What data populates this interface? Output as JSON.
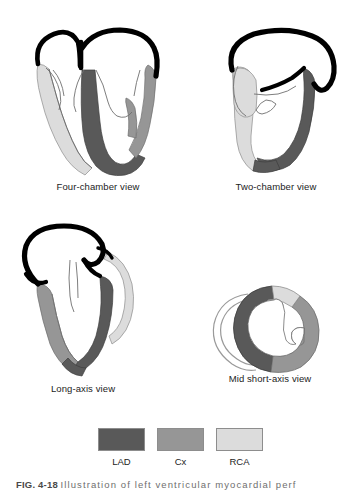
{
  "figure": {
    "number": "FIG. 4-18",
    "caption_text": "Illustration of left ventricular myocardial perf",
    "background_color": "#ffffff"
  },
  "panels": [
    {
      "id": "four-chamber",
      "label": "Four-chamber view",
      "territories": [
        "LAD",
        "Cx",
        "RCA"
      ]
    },
    {
      "id": "two-chamber",
      "label": "Two-chamber view",
      "territories": [
        "LAD",
        "RCA"
      ]
    },
    {
      "id": "long-axis",
      "label": "Long-axis view",
      "territories": [
        "LAD",
        "Cx",
        "RCA"
      ]
    },
    {
      "id": "short-axis",
      "label": "Mid short-axis view",
      "territories": [
        "LAD",
        "Cx",
        "RCA"
      ]
    }
  ],
  "legend": {
    "items": [
      {
        "key": "lad",
        "label": "LAD",
        "color": "#595959"
      },
      {
        "key": "cx",
        "label": "Cx",
        "color": "#969696"
      },
      {
        "key": "rca",
        "label": "RCA",
        "color": "#dcdcdc"
      }
    ]
  },
  "colors": {
    "lad": "#595959",
    "cx": "#969696",
    "rca": "#dcdcdc",
    "outline_heavy": "#000000",
    "outline_light": "#7a7a7a",
    "chamber_fill": "#ffffff"
  }
}
